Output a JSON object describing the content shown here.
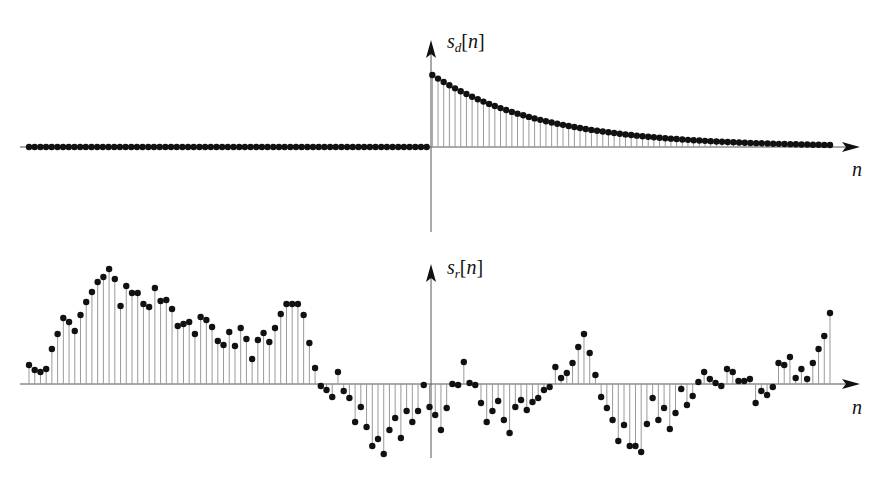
{
  "chart_data": [
    {
      "type": "stem",
      "title": "",
      "ylabel": "s_d[n]",
      "ylabel_parts": {
        "base": "s",
        "sub": "d",
        "arg": "n"
      },
      "xlabel": "n",
      "description": "Zero for n < 0, decaying exponential for n >= 0",
      "n_start": -71,
      "n_end": 70,
      "values_negative_n": "all 0 (71 samples)",
      "decay_ratio": 0.95,
      "initial_value": 1.0,
      "grid": false,
      "legend": null
    },
    {
      "type": "stem",
      "title": "",
      "ylabel": "s_r[n]",
      "ylabel_parts": {
        "base": "s",
        "sub": "r",
        "arg": "n"
      },
      "xlabel": "n",
      "description": "Random-looking signal",
      "n_start": -71,
      "n_end": 70,
      "values": [
        1.9,
        1.4,
        1.2,
        1.5,
        3.5,
        5.0,
        6.6,
        6.2,
        5.3,
        6.9,
        8.2,
        9.2,
        10.2,
        10.7,
        11.5,
        10.5,
        7.8,
        9.8,
        9.1,
        9.1,
        8.0,
        7.7,
        9.6,
        8.3,
        8.4,
        7.5,
        5.8,
        6.0,
        6.2,
        5.0,
        6.7,
        6.4,
        5.7,
        4.3,
        3.9,
        5.2,
        3.8,
        5.6,
        4.5,
        2.5,
        4.4,
        5.1,
        4.2,
        5.6,
        7.0,
        8.0,
        8.0,
        8.0,
        6.9,
        4.1,
        1.6,
        -0.2,
        -0.6,
        -1.3,
        1.2,
        -0.7,
        -1.4,
        -3.8,
        -2.3,
        -4.3,
        -6.2,
        -5.5,
        -7.0,
        -4.6,
        -3.4,
        -5.4,
        -2.7,
        -3.8,
        -2.7,
        -0.1,
        -2.3,
        -3.1,
        -4.6,
        -2.4,
        0.0,
        -0.1,
        2.2,
        0.1,
        -0.1,
        -1.9,
        -3.8,
        -2.7,
        -1.7,
        -3.6,
        -4.9,
        -2.3,
        -1.6,
        -2.6,
        -1.8,
        -1.4,
        -0.6,
        -0.3,
        1.7,
        0.6,
        1.1,
        2.1,
        3.7,
        5.0,
        3.1,
        0.9,
        -1.3,
        -2.4,
        -3.6,
        -5.7,
        -4.1,
        -6.2,
        -6.2,
        -6.8,
        -4.0,
        -1.4,
        -3.6,
        -2.4,
        -4.5,
        -2.9,
        -0.5,
        -2.1,
        -1.2,
        0.2,
        1.2,
        0.5,
        0.1,
        -0.2,
        1.5,
        1.2,
        0.3,
        0.3,
        0.5,
        -1.9,
        -0.7,
        -1.1,
        -0.3,
        2.1,
        1.9,
        2.7,
        0.6,
        1.5,
        0.5,
        2.1,
        3.5,
        4.8,
        7.1
      ],
      "grid": false,
      "legend": null
    }
  ],
  "labels": {
    "top_y": {
      "base": "s",
      "sub": "d",
      "arg": "n"
    },
    "top_x": "n",
    "bottom_y": {
      "base": "s",
      "sub": "r",
      "arg": "n"
    },
    "bottom_x": "n"
  },
  "colors": {
    "stem": "#9a9a9a",
    "dot": "#111111",
    "axis": "#555555"
  }
}
